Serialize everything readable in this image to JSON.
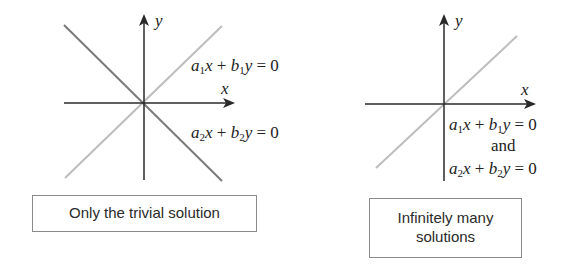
{
  "colors": {
    "axis": "#2a2a2a",
    "line_dark": "#7a7a7a",
    "line_light": "#bdbdbd",
    "text": "#222222",
    "box_border": "#8a8a8a"
  },
  "left_panel": {
    "axis_x_label": "x",
    "axis_y_label": "y",
    "eq1": {
      "a": "a",
      "a_sub": "1",
      "x": "x",
      "plus": " + ",
      "b": "b",
      "b_sub": "1",
      "y": "y",
      "rhs": " = 0"
    },
    "eq2": {
      "a": "a",
      "a_sub": "2",
      "x": "x",
      "plus": " + ",
      "b": "b",
      "b_sub": "2",
      "y": "y",
      "rhs": " = 0"
    },
    "caption": "Only the trivial solution"
  },
  "right_panel": {
    "axis_x_label": "x",
    "axis_y_label": "y",
    "eq1": {
      "a": "a",
      "a_sub": "1",
      "x": "x",
      "plus": " + ",
      "b": "b",
      "b_sub": "1",
      "y": "y",
      "rhs": " = 0"
    },
    "conjunction": "and",
    "eq2": {
      "a": "a",
      "a_sub": "2",
      "x": "x",
      "plus": " + ",
      "b": "b",
      "b_sub": "2",
      "y": "y",
      "rhs": " = 0"
    },
    "caption_line1": "Infinitely many",
    "caption_line2": "solutions"
  }
}
